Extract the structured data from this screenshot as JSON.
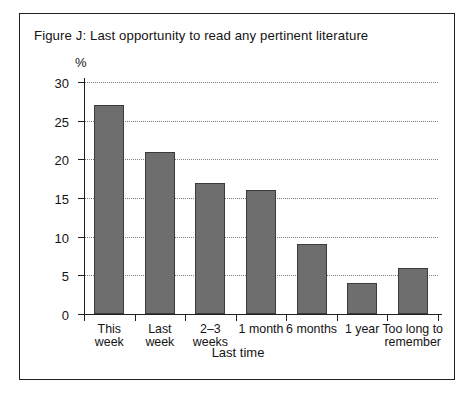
{
  "figure": {
    "title": "Figure J: Last opportunity to read any pertinent literature",
    "percent_label": "%",
    "frame_color": "#231f20",
    "background": "#ffffff"
  },
  "chart_data": {
    "type": "bar",
    "title": "Figure J: Last opportunity to read any pertinent literature",
    "categories": [
      "This week",
      "Last week",
      "2–3 weeks",
      "1 month",
      "6 months",
      "1 year",
      "Too long to remember"
    ],
    "values": [
      27,
      21,
      17,
      16,
      9,
      4,
      6
    ],
    "xlabel": "Last time",
    "ylabel": "%",
    "ylim": [
      0,
      30
    ],
    "ytick_values": [
      0,
      5,
      10,
      15,
      20,
      25,
      30
    ],
    "ytick_labels": [
      "0",
      "5",
      "10",
      "15",
      "20",
      "25",
      "30"
    ],
    "grid": "horizontal-dotted",
    "legend": null,
    "bar_color": "#6e6e6e",
    "bar_edge_color": "#3b3b3b"
  },
  "labels_wrapped": [
    [
      "This",
      "week"
    ],
    [
      "Last",
      "week"
    ],
    [
      "2–3",
      "weeks"
    ],
    [
      "1 month"
    ],
    [
      "6 months"
    ],
    [
      "1 year"
    ],
    [
      "Too long to",
      "remember"
    ]
  ]
}
